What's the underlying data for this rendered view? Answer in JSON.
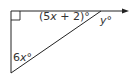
{
  "diagram": {
    "type": "right-triangle-exterior-angle",
    "colors": {
      "stroke": "#222222",
      "text": "#333333"
    },
    "labels": {
      "top_angle": {
        "prefix": "(5",
        "var": "x",
        "suffix": " + 2)°"
      },
      "exterior_angle": {
        "var": "y",
        "suffix": "°"
      },
      "bottom_angle": {
        "prefix": "6",
        "var": "x",
        "suffix": "°"
      }
    },
    "right_angle_marker": true,
    "arrow_on_top_edge": true
  }
}
